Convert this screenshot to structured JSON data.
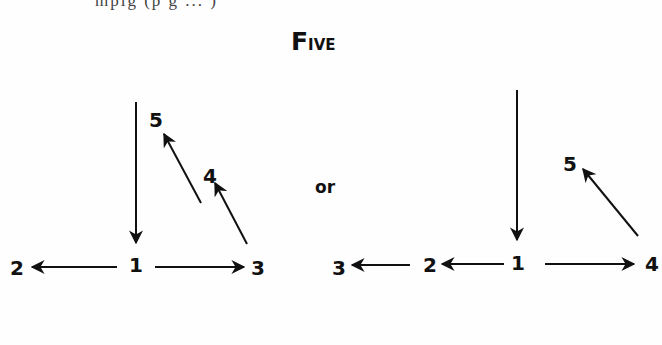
{
  "header": {
    "cutoff_text": "mpig (p g ... )",
    "title_first": "F",
    "title_rest": "IVE"
  },
  "separator": "or",
  "diagram_left": {
    "nodes": [
      {
        "id": "1",
        "label": "1",
        "x": 136,
        "y": 265
      },
      {
        "id": "2",
        "label": "2",
        "x": 17,
        "y": 268
      },
      {
        "id": "3",
        "label": "3",
        "x": 258,
        "y": 268
      },
      {
        "id": "4",
        "label": "4",
        "x": 210,
        "y": 176
      },
      {
        "id": "5",
        "label": "5",
        "x": 156,
        "y": 120
      }
    ],
    "edges": [
      {
        "from": "top",
        "to": "1",
        "x1": 136,
        "y1": 102,
        "x2": 136,
        "y2": 243
      },
      {
        "from": "1",
        "to": "2",
        "x1": 117,
        "y1": 267,
        "x2": 32,
        "y2": 267
      },
      {
        "from": "1",
        "to": "3",
        "x1": 155,
        "y1": 267,
        "x2": 244,
        "y2": 267
      },
      {
        "from": "3",
        "to": "4",
        "x1": 247,
        "y1": 244,
        "x2": 215,
        "y2": 183
      },
      {
        "from": "4",
        "to": "5",
        "x1": 201,
        "y1": 203,
        "x2": 164,
        "y2": 134
      }
    ]
  },
  "diagram_right": {
    "nodes": [
      {
        "id": "1",
        "label": "1",
        "x": 518,
        "y": 263
      },
      {
        "id": "2",
        "label": "2",
        "x": 430,
        "y": 265
      },
      {
        "id": "3",
        "label": "3",
        "x": 339,
        "y": 268
      },
      {
        "id": "4",
        "label": "4",
        "x": 652,
        "y": 264
      },
      {
        "id": "5",
        "label": "5",
        "x": 570,
        "y": 164
      }
    ],
    "edges": [
      {
        "from": "top",
        "to": "1",
        "x1": 517,
        "y1": 90,
        "x2": 517,
        "y2": 240
      },
      {
        "from": "1",
        "to": "2",
        "x1": 504,
        "y1": 264,
        "x2": 442,
        "y2": 264
      },
      {
        "from": "2",
        "to": "3",
        "x1": 410,
        "y1": 265,
        "x2": 352,
        "y2": 265
      },
      {
        "from": "1",
        "to": "4",
        "x1": 545,
        "y1": 264,
        "x2": 634,
        "y2": 264
      },
      {
        "from": "4",
        "to": "5",
        "x1": 638,
        "y1": 236,
        "x2": 583,
        "y2": 169
      }
    ]
  }
}
